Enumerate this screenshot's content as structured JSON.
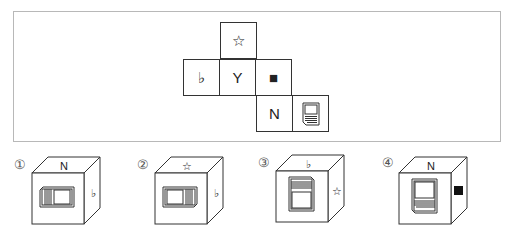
{
  "question": {
    "net": {
      "cells": [
        {
          "pos": "top",
          "symbol": "☆",
          "icon": "star-outline"
        },
        {
          "pos": "middle-left",
          "symbol": "♭",
          "icon": "flat-sign"
        },
        {
          "pos": "middle-center",
          "symbol": "Y",
          "icon": "letter-y"
        },
        {
          "pos": "middle-right",
          "symbol": "■",
          "icon": "black-square"
        },
        {
          "pos": "bottom-left",
          "symbol": "N",
          "icon": "letter-n"
        },
        {
          "pos": "bottom-right",
          "symbol": "",
          "icon": "document-icon"
        }
      ]
    }
  },
  "options": [
    {
      "label": "①",
      "top": "N",
      "front": "document-rotated",
      "right": "♭"
    },
    {
      "label": "②",
      "top": "☆",
      "front": "document-rotated-opposite",
      "right": "♭"
    },
    {
      "label": "③",
      "top": "♭",
      "front": "document-upright-inverted",
      "right": "☆"
    },
    {
      "label": "④",
      "top": "N",
      "front": "document-upright",
      "right": "■"
    }
  ]
}
